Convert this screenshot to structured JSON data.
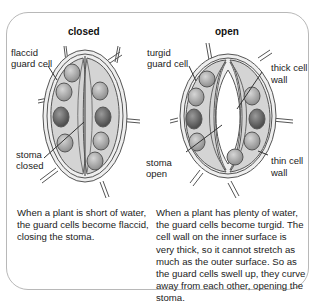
{
  "diagram": {
    "closed": {
      "title": "closed",
      "labels": {
        "guard_cell_1": "flaccid",
        "guard_cell_2": "guard cell",
        "stoma_1": "stoma",
        "stoma_2": "closed"
      },
      "caption": "When a plant is short of water, the guard cells become flaccid, closing the stoma."
    },
    "open": {
      "title": "open",
      "labels": {
        "guard_cell_1": "turgid",
        "guard_cell_2": "guard cell",
        "thick_1": "thick cell",
        "thick_2": "wall",
        "stoma_1": "stoma",
        "stoma_2": "open",
        "thin_1": "thin cell",
        "thin_2": "wall"
      },
      "caption": "When a plant has plenty of water, the guard cells become turgid. The cell wall on the inner surface is very thick, so it cannot stretch as much as the outer surface. So as the guard cells swell up, they curve away from each other, opening the stoma."
    },
    "colors": {
      "cell_fill": "#d4d4d4",
      "wall_fill": "#eeeeee",
      "outline": "#555555",
      "chloroplast_light": "#b0b0b0",
      "chloroplast_dark": "#6e6e6e"
    }
  }
}
